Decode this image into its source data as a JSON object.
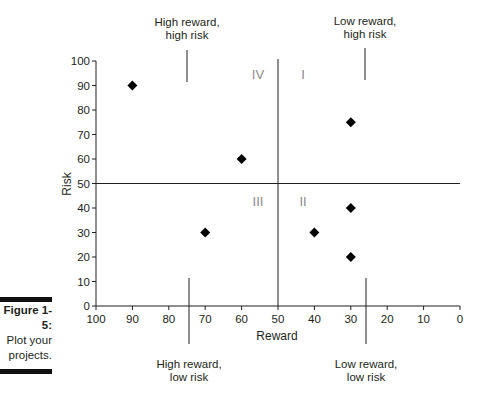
{
  "figure": {
    "number": "Figure 1-5:",
    "caption_line1": "Plot your",
    "caption_line2": "projects."
  },
  "chart_data": {
    "type": "scatter",
    "title": "",
    "xlabel": "Reward",
    "ylabel": "Risk",
    "xlim": [
      100,
      0
    ],
    "ylim": [
      0,
      100
    ],
    "x_axis_reversed": true,
    "xticks": [
      "100",
      "90",
      "80",
      "70",
      "60",
      "50",
      "40",
      "30",
      "20",
      "10",
      "0"
    ],
    "yticks": [
      "0",
      "10",
      "20",
      "30",
      "40",
      "50",
      "60",
      "70",
      "80",
      "90",
      "100"
    ],
    "grid": false,
    "marker": "diamond",
    "points": [
      {
        "x": 90,
        "y": 90
      },
      {
        "x": 60,
        "y": 60
      },
      {
        "x": 30,
        "y": 75
      },
      {
        "x": 70,
        "y": 30
      },
      {
        "x": 40,
        "y": 30
      },
      {
        "x": 30,
        "y": 40
      },
      {
        "x": 30,
        "y": 20
      }
    ],
    "divider_lines": {
      "x": 50,
      "y": 50
    },
    "quadrants": [
      {
        "label": "IV",
        "position": "upper-left"
      },
      {
        "label": "I",
        "position": "upper-right"
      },
      {
        "label": "III",
        "position": "lower-left"
      },
      {
        "label": "II",
        "position": "lower-right"
      }
    ],
    "annotations": [
      {
        "line1": "High reward,",
        "line2": "high risk",
        "position": "top-left"
      },
      {
        "line1": "Low reward,",
        "line2": "high risk",
        "position": "top-right"
      },
      {
        "line1": "High reward,",
        "line2": "low risk",
        "position": "bottom-left"
      },
      {
        "line1": "Low reward,",
        "line2": "low risk",
        "position": "bottom-right"
      }
    ]
  }
}
